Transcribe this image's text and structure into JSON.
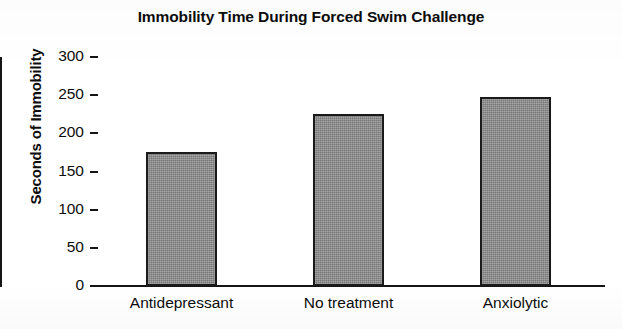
{
  "chart_data": {
    "type": "bar",
    "title": "Immobility Time During Forced Swim Challenge",
    "xlabel": "",
    "ylabel": "Seconds of Immobility",
    "categories": [
      "Antidepressant",
      "No treatment",
      "Anxiolytic"
    ],
    "values": [
      175,
      225,
      248
    ],
    "ylim": [
      0,
      300
    ],
    "yticks": [
      0,
      50,
      100,
      150,
      200,
      250,
      300
    ],
    "ytick_labels": [
      "0",
      "50",
      "100",
      "150",
      "200",
      "250",
      "300"
    ],
    "grid": false,
    "legend": null,
    "bar_fill_color": "#838383",
    "bar_edge_color": "#1a1a1a",
    "axis_color": "#151515",
    "background_color": "#ffffff",
    "series": [
      {
        "name": "Seconds of Immobility",
        "values": [
          175,
          225,
          248
        ]
      }
    ]
  }
}
